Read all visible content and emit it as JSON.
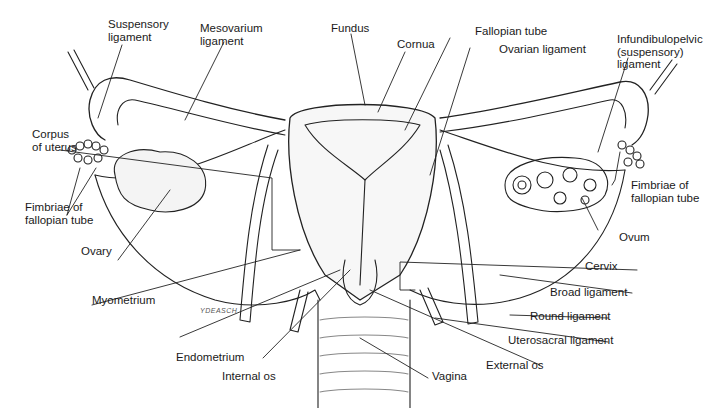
{
  "diagram": {
    "signature": "YDEASCH",
    "labels": {
      "suspensory_ligament": "Suspensory\nligament",
      "mesovarium_ligament": "Mesovarium\nligament",
      "fundus": "Fundus",
      "cornua": "Cornua",
      "fallopian_tube": "Fallopian tube",
      "ovarian_ligament": "Ovarian ligament",
      "infundibulopelvic_ligament": "Infundibulopelvic\n(suspensory)\nligament",
      "corpus_of_uterus": "Corpus\nof uterus",
      "fimbriae_left": "Fimbriae of\nfallopian tube",
      "fimbriae_right": "Fimbriae of\nfallopian tube",
      "ovary": "Ovary",
      "ovum": "Ovum",
      "myometrium": "Myometrium",
      "cervix": "Cervix",
      "broad_ligament": "Broad ligament",
      "round_ligament": "Round ligament",
      "uterosacral_ligament": "Uterosacral ligament",
      "endometrium": "Endometrium",
      "external_os": "External os",
      "internal_os": "Internal os",
      "vagina": "Vagina"
    }
  }
}
